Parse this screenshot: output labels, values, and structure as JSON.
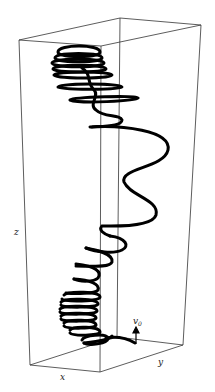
{
  "figure": {
    "type": "3d-trajectory-plot",
    "axes": {
      "x_label": "x",
      "y_label": "y",
      "z_label": "z"
    },
    "annotation": {
      "velocity_label": "v",
      "velocity_subscript": "0"
    },
    "colors": {
      "background": "#ffffff",
      "box": "#333333",
      "trajectory": "#000000"
    }
  }
}
